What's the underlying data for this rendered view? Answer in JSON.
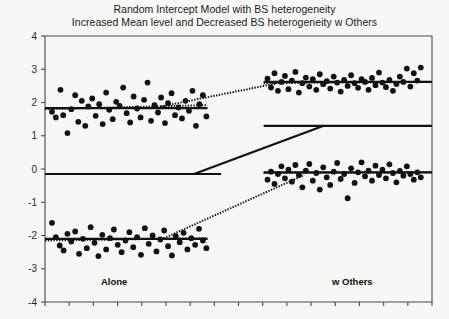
{
  "title": {
    "line1": "Random Intercept Model with BS heterogeneity",
    "line2": "Increased Mean level and Decreased BS heterogeneity w Others"
  },
  "axis": {
    "x_left_label": "Alone",
    "x_right_label": "w Others",
    "y_ticks": [
      "4",
      "3",
      "2",
      "1",
      "0",
      "-1",
      "-2",
      "-3",
      "-4"
    ]
  },
  "colors": {
    "background": "#f7f7f5",
    "ink": "#111111",
    "frame": "#4a4a4a",
    "point": "#121212"
  },
  "chart_data": {
    "type": "scatter",
    "xlabel": "",
    "ylabel": "",
    "xlim": [
      0,
      1
    ],
    "ylim": [
      -4,
      4
    ],
    "grid": false,
    "legend": null,
    "x_category_labels": [
      "Alone",
      "w Others"
    ],
    "y_tick_values": [
      4,
      3,
      2,
      1,
      0,
      -1,
      -2,
      -3,
      -4
    ],
    "series": [
      {
        "name": "Group A - Alone",
        "comment": "upper-left cluster, mean ~1.85, wide between-subject spread",
        "points": [
          [
            0.018,
            1.72
          ],
          [
            0.028,
            1.55
          ],
          [
            0.04,
            2.38
          ],
          [
            0.047,
            1.62
          ],
          [
            0.058,
            1.08
          ],
          [
            0.068,
            1.8
          ],
          [
            0.078,
            2.22
          ],
          [
            0.086,
            1.42
          ],
          [
            0.095,
            2.05
          ],
          [
            0.104,
            1.3
          ],
          [
            0.112,
            1.88
          ],
          [
            0.122,
            2.12
          ],
          [
            0.131,
            1.6
          ],
          [
            0.14,
            1.95
          ],
          [
            0.149,
            1.35
          ],
          [
            0.158,
            2.3
          ],
          [
            0.166,
            1.78
          ],
          [
            0.175,
            1.5
          ],
          [
            0.184,
            2.02
          ],
          [
            0.193,
            1.9
          ],
          [
            0.202,
            2.45
          ],
          [
            0.211,
            1.68
          ],
          [
            0.22,
            1.4
          ],
          [
            0.229,
            2.18
          ],
          [
            0.238,
            1.82
          ],
          [
            0.247,
            1.55
          ],
          [
            0.256,
            2.08
          ],
          [
            0.265,
            2.6
          ],
          [
            0.274,
            1.45
          ],
          [
            0.283,
            1.92
          ],
          [
            0.292,
            1.7
          ],
          [
            0.3,
            2.15
          ],
          [
            0.31,
            1.38
          ],
          [
            0.318,
            1.98
          ],
          [
            0.327,
            2.28
          ],
          [
            0.336,
            1.62
          ],
          [
            0.345,
            1.85
          ],
          [
            0.354,
            1.52
          ],
          [
            0.363,
            2.05
          ],
          [
            0.372,
            1.75
          ],
          [
            0.381,
            2.35
          ],
          [
            0.39,
            1.3
          ],
          [
            0.399,
            1.95
          ],
          [
            0.408,
            2.22
          ],
          [
            0.417,
            1.58
          ]
        ]
      },
      {
        "name": "Group A - w Others",
        "comment": "upper-right cluster, mean ~2.62, reduced spread",
        "points": [
          [
            0.575,
            2.72
          ],
          [
            0.584,
            2.45
          ],
          [
            0.593,
            2.88
          ],
          [
            0.602,
            2.35
          ],
          [
            0.611,
            2.62
          ],
          [
            0.62,
            2.8
          ],
          [
            0.629,
            2.4
          ],
          [
            0.638,
            2.66
          ],
          [
            0.647,
            2.92
          ],
          [
            0.656,
            2.3
          ],
          [
            0.665,
            2.58
          ],
          [
            0.674,
            2.75
          ],
          [
            0.683,
            2.48
          ],
          [
            0.692,
            2.7
          ],
          [
            0.701,
            2.38
          ],
          [
            0.71,
            2.85
          ],
          [
            0.719,
            2.55
          ],
          [
            0.728,
            2.64
          ],
          [
            0.737,
            2.42
          ],
          [
            0.746,
            2.78
          ],
          [
            0.755,
            2.6
          ],
          [
            0.764,
            2.33
          ],
          [
            0.773,
            2.68
          ],
          [
            0.782,
            2.5
          ],
          [
            0.791,
            2.82
          ],
          [
            0.8,
            2.58
          ],
          [
            0.809,
            2.44
          ],
          [
            0.818,
            2.7
          ],
          [
            0.827,
            2.62
          ],
          [
            0.836,
            2.38
          ],
          [
            0.845,
            2.74
          ],
          [
            0.854,
            2.52
          ],
          [
            0.863,
            2.9
          ],
          [
            0.872,
            2.6
          ],
          [
            0.881,
            2.46
          ],
          [
            0.89,
            2.68
          ],
          [
            0.899,
            2.35
          ],
          [
            0.908,
            2.56
          ],
          [
            0.917,
            2.78
          ],
          [
            0.926,
            2.62
          ],
          [
            0.935,
            3.02
          ],
          [
            0.944,
            2.48
          ],
          [
            0.953,
            2.88
          ],
          [
            0.962,
            2.66
          ],
          [
            0.971,
            3.05
          ]
        ]
      },
      {
        "name": "Group B - Alone",
        "comment": "lower-left cluster, mean ~-2.12, wide spread",
        "points": [
          [
            0.018,
            -1.62
          ],
          [
            0.028,
            -2.05
          ],
          [
            0.038,
            -2.3
          ],
          [
            0.048,
            -2.45
          ],
          [
            0.058,
            -1.95
          ],
          [
            0.068,
            -2.18
          ],
          [
            0.078,
            -1.88
          ],
          [
            0.088,
            -2.55
          ],
          [
            0.098,
            -2.1
          ],
          [
            0.108,
            -2.38
          ],
          [
            0.118,
            -1.75
          ],
          [
            0.128,
            -2.22
          ],
          [
            0.138,
            -2.62
          ],
          [
            0.148,
            -1.98
          ],
          [
            0.158,
            -2.42
          ],
          [
            0.168,
            -2.08
          ],
          [
            0.178,
            -1.82
          ],
          [
            0.188,
            -2.28
          ],
          [
            0.198,
            -2.5
          ],
          [
            0.208,
            -2.15
          ],
          [
            0.218,
            -1.9
          ],
          [
            0.228,
            -2.35
          ],
          [
            0.238,
            -2.05
          ],
          [
            0.248,
            -2.58
          ],
          [
            0.258,
            -1.78
          ],
          [
            0.268,
            -2.25
          ],
          [
            0.278,
            -2.0
          ],
          [
            0.288,
            -2.48
          ],
          [
            0.298,
            -2.12
          ],
          [
            0.308,
            -1.85
          ],
          [
            0.318,
            -2.32
          ],
          [
            0.328,
            -2.6
          ],
          [
            0.338,
            -2.02
          ],
          [
            0.348,
            -2.2
          ],
          [
            0.358,
            -1.92
          ],
          [
            0.368,
            -2.42
          ],
          [
            0.378,
            -2.08
          ],
          [
            0.388,
            -2.28
          ],
          [
            0.398,
            -1.8
          ],
          [
            0.408,
            -2.15
          ],
          [
            0.417,
            -2.38
          ]
        ]
      },
      {
        "name": "Group B - w Others",
        "comment": "lower-right cluster, mean ~-0.12, reduced spread",
        "points": [
          [
            0.575,
            -0.32
          ],
          [
            0.584,
            -0.08
          ],
          [
            0.593,
            -0.45
          ],
          [
            0.602,
            -0.15
          ],
          [
            0.611,
            0.08
          ],
          [
            0.62,
            -0.28
          ],
          [
            0.629,
            -0.02
          ],
          [
            0.638,
            -0.38
          ],
          [
            0.647,
            0.12
          ],
          [
            0.656,
            -0.18
          ],
          [
            0.665,
            -0.55
          ],
          [
            0.674,
            -0.05
          ],
          [
            0.683,
            0.15
          ],
          [
            0.692,
            -0.35
          ],
          [
            0.701,
            -0.12
          ],
          [
            0.71,
            -0.62
          ],
          [
            0.719,
            0.05
          ],
          [
            0.728,
            -0.25
          ],
          [
            0.737,
            -0.48
          ],
          [
            0.746,
            -0.08
          ],
          [
            0.755,
            0.18
          ],
          [
            0.764,
            -0.3
          ],
          [
            0.773,
            -0.15
          ],
          [
            0.782,
            -0.88
          ],
          [
            0.791,
            0.02
          ],
          [
            0.8,
            -0.42
          ],
          [
            0.809,
            -0.1
          ],
          [
            0.818,
            0.2
          ],
          [
            0.827,
            -0.22
          ],
          [
            0.836,
            -0.05
          ],
          [
            0.845,
            -0.35
          ],
          [
            0.854,
            0.1
          ],
          [
            0.863,
            -0.18
          ],
          [
            0.872,
            -0.02
          ],
          [
            0.881,
            -0.28
          ],
          [
            0.89,
            0.14
          ],
          [
            0.899,
            -0.12
          ],
          [
            0.908,
            -0.4
          ],
          [
            0.917,
            -0.06
          ],
          [
            0.926,
            -0.2
          ],
          [
            0.935,
            0.08
          ],
          [
            0.944,
            -0.15
          ],
          [
            0.953,
            -0.32
          ],
          [
            0.962,
            -0.1
          ],
          [
            0.971,
            -0.25
          ]
        ]
      }
    ],
    "reference_lines": [
      {
        "name": "solid-flat-left",
        "style": "solid",
        "x0": 0.0,
        "y0": -0.15,
        "x1": 0.455,
        "y1": -0.15
      },
      {
        "name": "solid-diagonal",
        "style": "solid",
        "x0": 0.385,
        "y0": -0.15,
        "x1": 0.72,
        "y1": 1.3
      },
      {
        "name": "solid-flat-right",
        "style": "solid",
        "x0": 0.565,
        "y0": 1.3,
        "x1": 1.0,
        "y1": 1.3
      },
      {
        "name": "dotted-upper-alone",
        "style": "dotted",
        "x0": 0.0,
        "y0": 1.8,
        "x1": 0.42,
        "y1": 1.92
      },
      {
        "name": "solid-upper-alone-mean",
        "style": "solid",
        "x0": 0.0,
        "y0": 1.83,
        "x1": 0.42,
        "y1": 1.83
      },
      {
        "name": "dotted-upper-connector",
        "style": "dotted",
        "x0": 0.3,
        "y0": 1.88,
        "x1": 0.6,
        "y1": 2.58
      },
      {
        "name": "dotted-upper-wothers",
        "style": "dotted",
        "x0": 0.565,
        "y0": 2.58,
        "x1": 1.0,
        "y1": 2.62
      },
      {
        "name": "solid-upper-wothers-mean",
        "style": "solid",
        "x0": 0.565,
        "y0": 2.62,
        "x1": 1.0,
        "y1": 2.62
      },
      {
        "name": "dotted-lower-alone",
        "style": "dotted",
        "x0": 0.0,
        "y0": -2.15,
        "x1": 0.42,
        "y1": -2.08
      },
      {
        "name": "solid-lower-alone-mean",
        "style": "solid",
        "x0": 0.0,
        "y0": -2.1,
        "x1": 0.42,
        "y1": -2.1
      },
      {
        "name": "dotted-lower-connector",
        "style": "dotted",
        "x0": 0.3,
        "y0": -2.12,
        "x1": 0.67,
        "y1": -0.18
      },
      {
        "name": "dotted-lower-wothers",
        "style": "dotted",
        "x0": 0.565,
        "y0": -0.12,
        "x1": 1.0,
        "y1": -0.1
      },
      {
        "name": "solid-lower-wothers-mean",
        "style": "solid",
        "x0": 0.565,
        "y0": -0.1,
        "x1": 1.0,
        "y1": -0.1
      }
    ]
  }
}
